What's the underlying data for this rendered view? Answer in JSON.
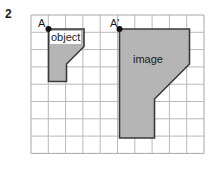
{
  "figure": {
    "problem_number": "2",
    "width": 222,
    "height": 169,
    "background_color": "#ffffff"
  },
  "grid": {
    "origin_x": 31,
    "origin_y": 15,
    "cell_size": 17.3,
    "columns": 10,
    "rows": 8,
    "line_color": "#b9b9b9",
    "border_color": "#a8a8a8"
  },
  "labels": {
    "point_a": "A",
    "point_a_prime": "A'",
    "object": "object",
    "image": "image"
  },
  "shapes": {
    "fill_color": "#b5b5b5",
    "stroke_color": "#3a3a3a",
    "object": {
      "name": "object",
      "points": "48.5,29 84,29 84,46.5 66.5,64 66.5,81.5 48.5,81.5",
      "anchor_point": {
        "label": "A",
        "x": 48.5,
        "y": 29
      }
    },
    "image": {
      "name": "image",
      "points": "119.5,29 189.5,29 189.5,64 154.5,99 154.5,138 119.5,138",
      "anchor_point": {
        "label": "A'",
        "x": 119.5,
        "y": 29
      }
    }
  },
  "chart_data": {
    "type": "diagram",
    "grid_units": {
      "columns": 10,
      "rows": 8
    },
    "figures": [
      {
        "name": "object",
        "anchor_label": "A",
        "anchor_grid": [
          1,
          0
        ],
        "vertices_grid": [
          [
            1,
            0
          ],
          [
            3,
            0
          ],
          [
            3,
            1
          ],
          [
            2,
            2
          ],
          [
            2,
            3
          ],
          [
            1,
            3
          ]
        ]
      },
      {
        "name": "image",
        "anchor_label": "A'",
        "anchor_grid": [
          5,
          0
        ],
        "vertices_grid": [
          [
            5,
            0
          ],
          [
            9,
            0
          ],
          [
            9,
            2
          ],
          [
            7,
            4
          ],
          [
            7,
            7
          ],
          [
            5,
            7
          ]
        ]
      }
    ],
    "scale_factor": 2
  }
}
